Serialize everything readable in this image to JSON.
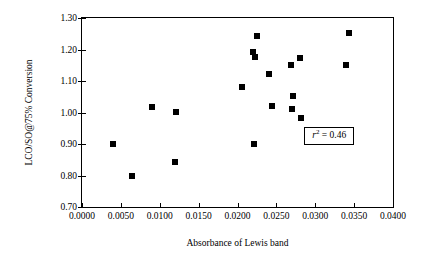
{
  "chart_data": {
    "type": "scatter",
    "title": "",
    "xlabel": "Absorbance of Lewis band",
    "ylabel": "LCO/SO@75% Conversion",
    "xlim": [
      0.0,
      0.04
    ],
    "ylim": [
      0.7,
      1.3
    ],
    "xticks": [
      0.0,
      0.005,
      0.01,
      0.015,
      0.02,
      0.025,
      0.03,
      0.035,
      0.04
    ],
    "xticklabels": [
      "0.0000",
      "0.0050",
      "0.0100",
      "0.0150",
      "0.0200",
      "0.0250",
      "0.0300",
      "0.0350",
      "0.0400"
    ],
    "yticks": [
      0.7,
      0.8,
      0.9,
      1.0,
      1.1,
      1.2,
      1.3
    ],
    "yticklabels": [
      "0.70",
      "0.80",
      "0.90",
      "1.00",
      "1.10",
      "1.20",
      "1.30"
    ],
    "grid": false,
    "legend": null,
    "marker": "filled-square",
    "marker_color": "#000000",
    "points": [
      {
        "x": 0.004,
        "y": 0.901
      },
      {
        "x": 0.0064,
        "y": 0.799
      },
      {
        "x": 0.009,
        "y": 1.018
      },
      {
        "x": 0.0121,
        "y": 1.002
      },
      {
        "x": 0.012,
        "y": 0.842
      },
      {
        "x": 0.0206,
        "y": 1.082
      },
      {
        "x": 0.022,
        "y": 1.193
      },
      {
        "x": 0.0222,
        "y": 1.176
      },
      {
        "x": 0.0225,
        "y": 1.242
      },
      {
        "x": 0.0221,
        "y": 0.901
      },
      {
        "x": 0.024,
        "y": 1.121
      },
      {
        "x": 0.0245,
        "y": 1.022
      },
      {
        "x": 0.0269,
        "y": 1.152
      },
      {
        "x": 0.0271,
        "y": 1.053
      },
      {
        "x": 0.027,
        "y": 1.012
      },
      {
        "x": 0.0281,
        "y": 1.172
      },
      {
        "x": 0.0282,
        "y": 0.981
      },
      {
        "x": 0.0343,
        "y": 1.252
      },
      {
        "x": 0.034,
        "y": 1.152
      }
    ],
    "annotations": [
      {
        "name": "r-squared",
        "symbol": "r",
        "superscript": "2",
        "equals": " = 0.46",
        "text": "r2 = 0.46",
        "x": 0.0318,
        "y": 0.925,
        "boxed": true
      }
    ]
  }
}
